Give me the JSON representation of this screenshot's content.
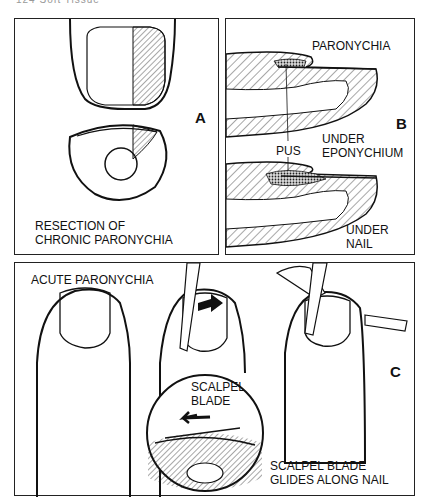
{
  "page_header": "124 Soft Tissue",
  "figure": {
    "panels": [
      {
        "id": "A",
        "letter": "A",
        "caption_line1": "RESECTION OF",
        "caption_line2": "CHRONIC PARONYCHIA"
      },
      {
        "id": "B",
        "letter": "B",
        "labels": {
          "paronychia": "PARONYCHIA",
          "pus": "PUS",
          "under_eponychium_1": "UNDER",
          "under_eponychium_2": "EPONYCHIUM",
          "under_nail_1": "UNDER",
          "under_nail_2": "NAIL"
        }
      },
      {
        "id": "C",
        "letter": "C",
        "labels": {
          "acute": "ACUTE PARONYCHIA",
          "scalpel_blade_1": "SCALPEL",
          "scalpel_blade_2": "BLADE",
          "glides_1": "SCALPEL BLADE",
          "glides_2": "GLIDES ALONG NAIL"
        }
      }
    ]
  }
}
